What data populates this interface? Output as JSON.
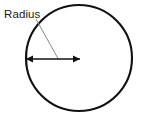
{
  "figure": {
    "type": "geometry-diagram",
    "background_color": "#ffffff",
    "width": 144,
    "height": 117
  },
  "labels": {
    "radius": "Radius"
  },
  "shapes": {
    "circle": {
      "name": "circle-outline",
      "center_x": 79,
      "center_y": 58,
      "radius": 53,
      "stroke_color": "#111111",
      "stroke_width": 2.1,
      "fill": "none"
    },
    "radius_arrow": {
      "name": "radius-dimension-arrow",
      "x1": 26,
      "y1": 59,
      "x2": 80,
      "y2": 59,
      "stroke_color": "#111111",
      "stroke_width": 1.6,
      "double_headed": true,
      "head_length": 7,
      "head_width": 7
    },
    "left_tick": {
      "name": "left-extension-tick",
      "x": 26.5,
      "y1": 51,
      "y2": 67,
      "stroke_color": "#111111",
      "stroke_width": 1.3
    },
    "leader_line": {
      "name": "label-leader-line",
      "x1": 36,
      "y1": 19,
      "x2": 58,
      "y2": 58.5,
      "stroke_color": "#8a8a8a",
      "stroke_width": 1
    }
  },
  "text_positions": {
    "radius_label": {
      "x": 4,
      "y": 18,
      "font_size": 11.5,
      "color": "#1a1a1a"
    }
  }
}
